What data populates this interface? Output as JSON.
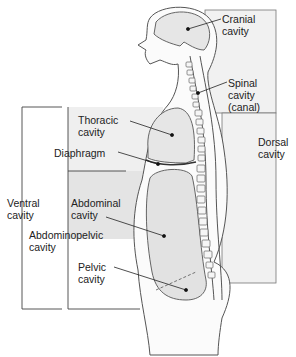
{
  "colors": {
    "dorsal_box": "#f1f1f1",
    "thoracic_box": "#efefef",
    "abdominopelvic_box": "#e4e4e4",
    "organ_fill": "#e2e2e2",
    "outline": "#555555",
    "bracket": "#444444"
  },
  "labels": {
    "cranial": [
      "Cranial",
      "cavity"
    ],
    "spinal": [
      "Spinal",
      "cavity",
      "(canal)"
    ],
    "dorsal": [
      "Dorsal",
      "cavity"
    ],
    "thoracic": [
      "Thoracic",
      "cavity"
    ],
    "diaphragm": "Diaphragm",
    "ventral": [
      "Ventral",
      "cavity"
    ],
    "abdominal": [
      "Abdominal",
      "cavity"
    ],
    "abdominopelvic": [
      "Abdominopelvic",
      "cavity"
    ],
    "pelvic": [
      "Pelvic",
      "cavity"
    ]
  }
}
